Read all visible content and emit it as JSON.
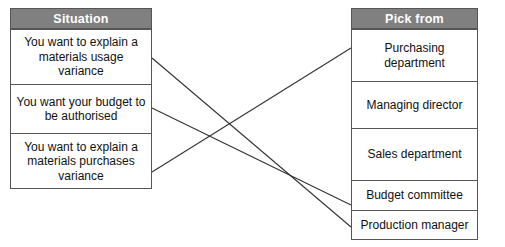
{
  "exercise": {
    "left_table": {
      "header": "Situation",
      "rows": [
        {
          "text": "You want to explain a materials usage variance"
        },
        {
          "text": "You want your budget to be authorised"
        },
        {
          "text": "You want to explain a materials purchases variance"
        }
      ]
    },
    "right_table": {
      "header": "Pick from",
      "options": [
        {
          "text": "Purchasing department"
        },
        {
          "text": "Managing director"
        },
        {
          "text": "Sales department"
        },
        {
          "text": "Budget committee"
        },
        {
          "text": "Production manager"
        }
      ]
    },
    "connections": [
      {
        "from_row": 0,
        "to_option": 4,
        "x1": 152,
        "y1": 58,
        "x2": 351,
        "y2": 227
      },
      {
        "from_row": 1,
        "to_option": 3,
        "x1": 152,
        "y1": 108,
        "x2": 351,
        "y2": 205
      },
      {
        "from_row": 2,
        "to_option": 0,
        "x1": 152,
        "y1": 172,
        "x2": 351,
        "y2": 48
      }
    ],
    "colors": {
      "header_background": "#808080",
      "header_text": "#ffffff",
      "border": "#555555",
      "body_text": "#111111",
      "connector_line": "#333333",
      "page_background": "#ffffff"
    }
  }
}
